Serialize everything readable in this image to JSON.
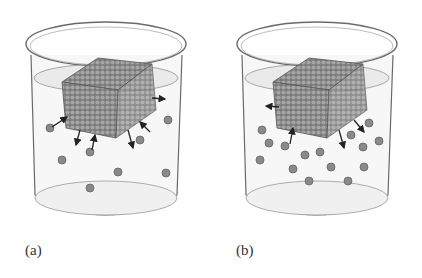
{
  "figure": {
    "panels": [
      {
        "id": "a",
        "label": "(a)",
        "description": "Crystal cube dissolving in solvent; few dissolved particles",
        "particles": [
          [
            50,
            128
          ],
          [
            168,
            120
          ],
          [
            62,
            160
          ],
          [
            90,
            152
          ],
          [
            140,
            140
          ],
          [
            118,
            172
          ],
          [
            166,
            173
          ],
          [
            90,
            188
          ]
        ],
        "arrows_out": [
          [
            152,
            98,
            165,
            99
          ],
          [
            80,
            130,
            76,
            145
          ],
          [
            128,
            130,
            133,
            148
          ]
        ],
        "arrows_in": [
          [
            52,
            127,
            67,
            117
          ],
          [
            92,
            150,
            95,
            135
          ],
          [
            150,
            132,
            140,
            122
          ]
        ]
      },
      {
        "id": "b",
        "label": "(b)",
        "description": "Crystal cube in solvent with more dissolved particles (approaching saturation)",
        "particles": [
          [
            51,
            130
          ],
          [
            58,
            143
          ],
          [
            74,
            146
          ],
          [
            49,
            160
          ],
          [
            82,
            169
          ],
          [
            94,
            155
          ],
          [
            109,
            152
          ],
          [
            120,
            167
          ],
          [
            140,
            135
          ],
          [
            152,
            147
          ],
          [
            158,
            123
          ],
          [
            168,
            141
          ],
          [
            153,
            167
          ],
          [
            98,
            181
          ],
          [
            137,
            181
          ]
        ],
        "arrows_out": [
          [
            68,
            107,
            55,
            106
          ],
          [
            143,
            120,
            153,
            132
          ],
          [
            128,
            130,
            133,
            148
          ]
        ],
        "arrows_in": [
          [
            79,
            144,
            82,
            128
          ]
        ]
      }
    ],
    "colors": {
      "particle": "#8a8a8a",
      "particle_edge": "#5a5a5a",
      "crystal": "#8d8d8d",
      "beaker_line": "#6a6a6a",
      "liquid": "#e9e9e9",
      "arrow": "#222222"
    }
  }
}
